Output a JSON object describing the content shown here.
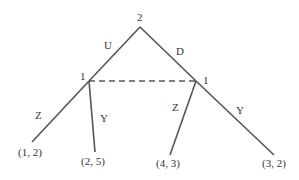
{
  "tree": {
    "root": {
      "player": "2"
    },
    "root_actions": [
      {
        "label": "U"
      },
      {
        "label": "D"
      }
    ],
    "info_set_nodes": [
      {
        "player": "1"
      },
      {
        "player": "1"
      }
    ],
    "player1_actions": {
      "left_node": [
        {
          "label": "Z"
        },
        {
          "label": "Y"
        }
      ],
      "right_node": [
        {
          "label": "Z"
        },
        {
          "label": "Y"
        }
      ]
    },
    "payoffs": [
      {
        "label": "(1, 2)"
      },
      {
        "label": "(2, 5)"
      },
      {
        "label": "(4, 3)"
      },
      {
        "label": "(3, 2)"
      }
    ],
    "colors": {
      "line": "#555555",
      "text": "#333333"
    }
  }
}
